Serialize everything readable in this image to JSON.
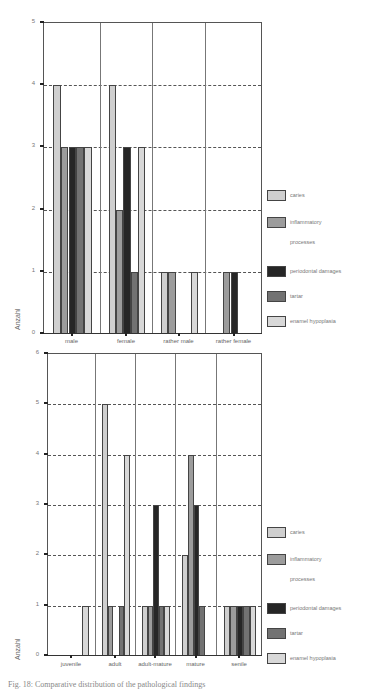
{
  "chart_data": [
    {
      "type": "bar",
      "title": "",
      "xlabel": "",
      "ylabel": "Anzahl",
      "ylim": [
        0,
        5
      ],
      "yticks": [
        0,
        1,
        2,
        3,
        4,
        5
      ],
      "grid": "horizontal dashed",
      "legend_position": "right",
      "categories": [
        "male",
        "female",
        "rather male",
        "rather female"
      ],
      "series": [
        {
          "name": "caries",
          "color": "#cfcfcf",
          "values": [
            4,
            4,
            1,
            0
          ]
        },
        {
          "name": "inflammatory processes",
          "color": "#9c9c9c",
          "values": [
            3,
            2,
            1,
            1
          ]
        },
        {
          "name": "periodontal damages",
          "color": "#262626",
          "values": [
            3,
            3,
            0,
            1
          ]
        },
        {
          "name": "tartar",
          "color": "#727272",
          "values": [
            3,
            1,
            0,
            0
          ]
        },
        {
          "name": "enamel hypoplasia",
          "color": "#d8d8d8",
          "values": [
            3,
            3,
            1,
            0
          ]
        }
      ]
    },
    {
      "type": "bar",
      "title": "",
      "xlabel": "",
      "ylabel": "Anzahl",
      "ylim": [
        0,
        6
      ],
      "yticks": [
        0,
        1,
        2,
        3,
        4,
        5,
        6
      ],
      "grid": "horizontal dashed",
      "legend_position": "right",
      "categories": [
        "juvenile",
        "adult",
        "adult-mature",
        "mature",
        "senile"
      ],
      "series": [
        {
          "name": "caries",
          "color": "#cfcfcf",
          "values": [
            0,
            5,
            1,
            2,
            1
          ]
        },
        {
          "name": "inflammatory processes",
          "color": "#9c9c9c",
          "values": [
            0,
            1,
            1,
            4,
            1
          ]
        },
        {
          "name": "periodontal damages",
          "color": "#262626",
          "values": [
            0,
            0,
            3,
            3,
            1
          ]
        },
        {
          "name": "tartar",
          "color": "#727272",
          "values": [
            0,
            1,
            1,
            1,
            1
          ]
        },
        {
          "name": "enamel hypoplasia",
          "color": "#d8d8d8",
          "values": [
            1,
            4,
            1,
            0,
            1
          ]
        }
      ]
    }
  ],
  "legend": {
    "items": [
      {
        "label_line1": "caries",
        "label_line2": ""
      },
      {
        "label_line1": "inflammatory",
        "label_line2": "processes"
      },
      {
        "label_line1": "periodontal damages",
        "label_line2": ""
      },
      {
        "label_line1": "tartar",
        "label_line2": ""
      },
      {
        "label_line1": "enamel hypoplasia",
        "label_line2": ""
      }
    ]
  },
  "caption": "Fig. 18: Comparative distribution of the pathological findings"
}
